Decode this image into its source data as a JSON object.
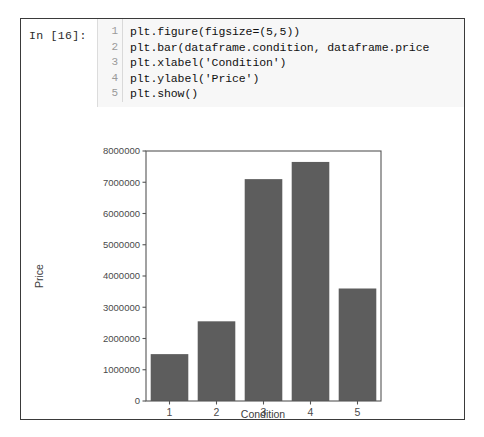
{
  "notebook": {
    "prompt": "In [16]:",
    "line_numbers": [
      "1",
      "2",
      "3",
      "4",
      "5"
    ],
    "code_lines": [
      "plt.figure(figsize=(5,5))",
      "plt.bar(dataframe.condition, dataframe.price",
      "plt.xlabel('Condition')",
      "plt.ylabel('Price')",
      "plt.show()"
    ]
  },
  "chart_data": {
    "type": "bar",
    "title": "",
    "categories": [
      "1",
      "2",
      "3",
      "4",
      "5"
    ],
    "values": [
      1500000,
      2550000,
      7100000,
      7650000,
      3600000
    ],
    "xlabel": "Condition",
    "ylabel": "Price",
    "ylim": [
      0,
      8000000
    ],
    "ytick_labels": [
      "0",
      "1000000",
      "2000000",
      "3000000",
      "4000000",
      "5000000",
      "6000000",
      "7000000",
      "8000000"
    ],
    "ytick_values": [
      0,
      1000000,
      2000000,
      3000000,
      4000000,
      5000000,
      6000000,
      7000000,
      8000000
    ],
    "grid": false,
    "legend": false,
    "bar_color": "#5d5d5d",
    "frame_color": "#555555"
  }
}
